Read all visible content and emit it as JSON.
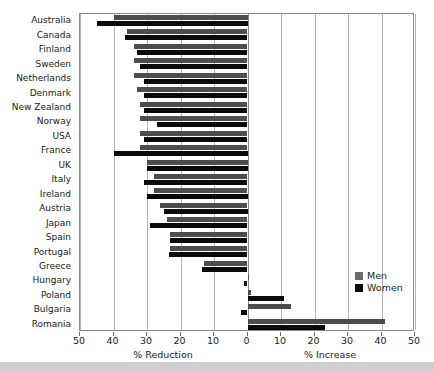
{
  "chart_data": {
    "type": "bar",
    "orientation": "horizontal",
    "title": "",
    "xlabel_left": "% Reduction",
    "xlabel_right": "% Increase",
    "ylabel": "",
    "xlim": [
      -50,
      50
    ],
    "xticks": [
      -50,
      -40,
      -30,
      -20,
      -10,
      0,
      10,
      20,
      30,
      40,
      50
    ],
    "xtick_labels": [
      "50",
      "40",
      "30",
      "20",
      "10",
      "0",
      "10",
      "20",
      "30",
      "40",
      "50"
    ],
    "grid": true,
    "legend_position": "lower-right",
    "categories": [
      "Australia",
      "Canada",
      "Finland",
      "Sweden",
      "Netherlands",
      "Denmark",
      "New Zealand",
      "Norway",
      "USA",
      "France",
      "UK",
      "Italy",
      "Ireland",
      "Austria",
      "Japan",
      "Spain",
      "Portugal",
      "Greece",
      "Hungary",
      "Poland",
      "Bulgaria",
      "Romania"
    ],
    "series": [
      {
        "name": "Men",
        "color": "#4d4d4d",
        "values": [
          -40,
          -36,
          -34,
          -34,
          -34,
          -33,
          -32,
          -32,
          -32,
          -32,
          -30,
          -28,
          -28,
          -26,
          -24,
          -23,
          -23,
          -13,
          0.5,
          1,
          13,
          41
        ]
      },
      {
        "name": "Women",
        "color": "#0a0a0a",
        "values": [
          -45,
          -36.5,
          -33,
          -32,
          -31,
          -31,
          -31,
          -27,
          -31,
          -40,
          -30,
          -31,
          -30,
          -25,
          -29,
          -23,
          -23.5,
          -13.5,
          -1,
          11,
          -2,
          23
        ]
      }
    ]
  },
  "legend": {
    "items": [
      {
        "label": "Men"
      },
      {
        "label": "Women"
      }
    ]
  },
  "colors": {
    "men": "#4d4d4d",
    "women": "#0a0a0a",
    "grid": "#b4b4b4",
    "axis": "#8a8a8a",
    "background": "#ffffff"
  }
}
